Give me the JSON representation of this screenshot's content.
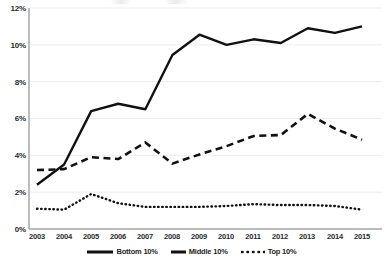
{
  "chart_data": {
    "type": "line",
    "title": "",
    "xlabel": "",
    "ylabel": "",
    "x": [
      "2003",
      "2004",
      "2005",
      "2006",
      "2007",
      "2008",
      "2009",
      "2010",
      "2011",
      "2012",
      "2013",
      "2014",
      "2015"
    ],
    "categories": [
      "2003",
      "2004",
      "2005",
      "2006",
      "2007",
      "2008",
      "2009",
      "2010",
      "2011",
      "2012",
      "2013",
      "2014",
      "2015"
    ],
    "ylim": [
      0,
      12
    ],
    "yticks": [
      0,
      2,
      4,
      6,
      8,
      10,
      12
    ],
    "ytick_labels": [
      "0%",
      "2%",
      "4%",
      "6%",
      "8%",
      "10%",
      "12%"
    ],
    "grid": "horizontal-faint",
    "legend_position": "bottom-center",
    "series": [
      {
        "name": "Bottom 10%",
        "style": "solid",
        "color": "#111111",
        "values": [
          2.4,
          3.5,
          6.4,
          6.8,
          6.5,
          9.45,
          10.55,
          10.0,
          10.3,
          10.1,
          10.9,
          10.65,
          11.0
        ]
      },
      {
        "name": "Middle 10%",
        "style": "dashed",
        "color": "#111111",
        "values": [
          3.2,
          3.25,
          3.9,
          3.8,
          4.7,
          3.55,
          4.05,
          4.5,
          5.05,
          5.1,
          6.25,
          5.45,
          4.85
        ]
      },
      {
        "name": "Top 10%",
        "style": "dotted",
        "color": "#111111",
        "values": [
          1.1,
          1.05,
          1.9,
          1.4,
          1.2,
          1.2,
          1.2,
          1.25,
          1.35,
          1.3,
          1.3,
          1.25,
          1.05
        ]
      }
    ]
  },
  "axes": {
    "y_ticks": [
      "12%",
      "10%",
      "8%",
      "6%",
      "4%",
      "2%",
      "0%"
    ],
    "x_ticks": [
      "2003",
      "2004",
      "2005",
      "2006",
      "2007",
      "2008",
      "2009",
      "2010",
      "2011",
      "2012",
      "2013",
      "2014",
      "2015"
    ]
  },
  "legend": {
    "items": [
      {
        "label": "Bottom 10%",
        "style": "solid"
      },
      {
        "label": "Middle 10%",
        "style": "dashed"
      },
      {
        "label": "Top 10%",
        "style": "dotted"
      }
    ]
  }
}
